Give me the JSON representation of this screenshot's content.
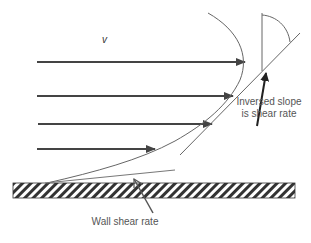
{
  "diagram": {
    "velocity_symbol": "v",
    "labels": {
      "slope_line1": "Inversed slope",
      "slope_line2": "is shear rate",
      "wall": "Wall shear rate"
    },
    "velocity_arrows": [
      {
        "y": 62,
        "x_start": 37,
        "x_end": 245
      },
      {
        "y": 96,
        "x_start": 37,
        "x_end": 233
      },
      {
        "y": 124,
        "x_start": 37,
        "x_end": 212
      },
      {
        "y": 149,
        "x_start": 37,
        "x_end": 155
      }
    ],
    "colors": {
      "arrow": "#444444",
      "line": "#666666",
      "text": "#555555",
      "wall_hatch": "#333333"
    }
  }
}
